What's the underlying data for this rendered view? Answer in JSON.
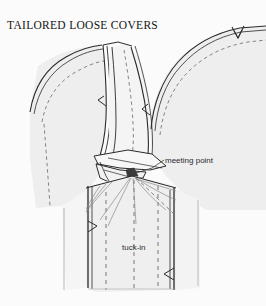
{
  "page": {
    "background_color": "#fbfbfb",
    "width": 266,
    "height": 306
  },
  "header": {
    "title": "TAILORED LOOSE COVERS"
  },
  "illustration": {
    "name": "chair-arm-back-junction-loose-cover",
    "description": "Line drawing of a tailored loose cover at the junction of chair arm and back, showing the V-shaped valley where panels meet and the tuck-in allowance below",
    "fabric_fill_color": "#eeeeee",
    "fabric_fill_color_light": "#f4f4f4",
    "outline_color": "#2a2a2a",
    "stitch_line_color": "#6a6a6a",
    "fold_line_color": "#8a8a8a",
    "notch_label": "v-notch"
  },
  "callouts": [
    {
      "id": "meeting-point",
      "label": "meeting point",
      "leader": "diagonal-leader-line"
    },
    {
      "id": "tuck-in",
      "label": "tuck-in",
      "leader": "none"
    }
  ]
}
